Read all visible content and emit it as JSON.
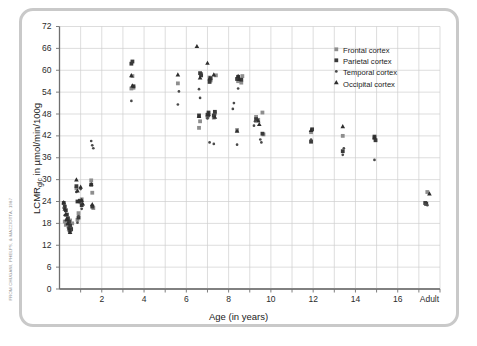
{
  "credit": "FROM CHUGANI, PHELPS, & MAZZIOTTA, 1987",
  "axes": {
    "xlabel": "Age (in years)",
    "ylabel_main": "LCMR",
    "ylabel_sub": "glc",
    "ylabel_rest": " in µmol/min/100g",
    "ylabel_full": "LCMRglc in µmol/min/100g",
    "y_ticks": [
      "0",
      "6",
      "12",
      "18",
      "24",
      "30",
      "36",
      "42",
      "48",
      "54",
      "60",
      "66",
      "72"
    ],
    "x_ticks": [
      "2",
      "4",
      "6",
      "8",
      "10",
      "12",
      "14",
      "16",
      "Adult"
    ]
  },
  "legend": {
    "items": [
      {
        "label": "Frontal cortex",
        "marker": "square",
        "color": "#8e8e8e"
      },
      {
        "label": "Parietal cortex",
        "marker": "square",
        "color": "#3a3a3a"
      },
      {
        "label": "Temporal cortex",
        "marker": "dot",
        "color": "#4a4a4a"
      },
      {
        "label": "Occipital cortex",
        "marker": "triangle",
        "color": "#2e2e2e"
      }
    ]
  },
  "colors": {
    "frontal": "#8e8e8e",
    "parietal": "#3a3a3a",
    "temporal": "#4a4a4a",
    "occipital": "#2e2e2e",
    "grid": "#cfcfcf",
    "axis": "#6f6f6f",
    "frame": "#c9c9c9"
  },
  "chart_data": {
    "type": "scatter",
    "title": "",
    "xlabel": "Age (in years)",
    "ylabel": "LCMRglc in µmol/min/100g",
    "xlim": [
      0,
      18
    ],
    "ylim": [
      0,
      72
    ],
    "ytick_step": 6,
    "xtick_step": 2,
    "x_gridline_step": 1,
    "grid": true,
    "legend_position": "top-right",
    "x_adult_value": 17.5,
    "series": [
      {
        "name": "Frontal cortex",
        "marker": "square",
        "color": "#8e8e8e",
        "points": [
          [
            0.25,
            18.5
          ],
          [
            0.3,
            17.6
          ],
          [
            0.35,
            19.0
          ],
          [
            0.4,
            18.2
          ],
          [
            0.45,
            17.2
          ],
          [
            0.5,
            18.8
          ],
          [
            0.55,
            16.6
          ],
          [
            0.6,
            18.0
          ],
          [
            0.8,
            27.6
          ],
          [
            0.85,
            19.0
          ],
          [
            0.9,
            20.8
          ],
          [
            1.0,
            23.8
          ],
          [
            1.05,
            24.6
          ],
          [
            1.5,
            29.8
          ],
          [
            1.55,
            26.4
          ],
          [
            1.6,
            22.2
          ],
          [
            3.4,
            55.0
          ],
          [
            3.45,
            58.4
          ],
          [
            3.5,
            55.2
          ],
          [
            5.6,
            56.4
          ],
          [
            6.6,
            44.2
          ],
          [
            6.65,
            46.0
          ],
          [
            6.7,
            59.0
          ],
          [
            7.0,
            47.2
          ],
          [
            7.05,
            47.8
          ],
          [
            7.1,
            58.0
          ],
          [
            7.15,
            57.2
          ],
          [
            7.3,
            47.0
          ],
          [
            7.35,
            48.2
          ],
          [
            7.4,
            58.6
          ],
          [
            8.4,
            43.6
          ],
          [
            8.45,
            57.0
          ],
          [
            8.6,
            56.6
          ],
          [
            8.65,
            58.4
          ],
          [
            9.3,
            47.2
          ],
          [
            9.4,
            46.4
          ],
          [
            9.6,
            48.4
          ],
          [
            9.65,
            42.4
          ],
          [
            11.9,
            43.0
          ],
          [
            13.4,
            42.0
          ],
          [
            14.9,
            41.4
          ],
          [
            17.4,
            26.6
          ]
        ]
      },
      {
        "name": "Parietal cortex",
        "marker": "square",
        "color": "#3a3a3a",
        "points": [
          [
            0.2,
            23.6
          ],
          [
            0.25,
            22.6
          ],
          [
            0.3,
            21.6
          ],
          [
            0.35,
            20.4
          ],
          [
            0.4,
            19.4
          ],
          [
            0.45,
            18.4
          ],
          [
            0.5,
            17.4
          ],
          [
            0.55,
            16.4
          ],
          [
            0.8,
            28.2
          ],
          [
            0.85,
            24.0
          ],
          [
            0.9,
            19.6
          ],
          [
            1.0,
            24.2
          ],
          [
            1.05,
            23.0
          ],
          [
            1.5,
            28.6
          ],
          [
            1.55,
            22.6
          ],
          [
            3.4,
            61.8
          ],
          [
            3.45,
            62.4
          ],
          [
            3.5,
            55.6
          ],
          [
            6.6,
            47.6
          ],
          [
            6.65,
            59.2
          ],
          [
            6.7,
            58.6
          ],
          [
            7.0,
            47.8
          ],
          [
            7.05,
            48.4
          ],
          [
            7.1,
            56.8
          ],
          [
            7.15,
            57.8
          ],
          [
            7.3,
            47.6
          ],
          [
            7.35,
            48.6
          ],
          [
            8.4,
            57.6
          ],
          [
            8.45,
            58.2
          ],
          [
            8.6,
            57.4
          ],
          [
            9.3,
            46.6
          ],
          [
            9.6,
            42.6
          ],
          [
            11.9,
            40.4
          ],
          [
            11.95,
            43.8
          ],
          [
            13.4,
            37.8
          ],
          [
            14.9,
            41.8
          ],
          [
            14.95,
            40.8
          ],
          [
            17.3,
            23.6
          ],
          [
            17.35,
            23.4
          ]
        ]
      },
      {
        "name": "Temporal cortex",
        "marker": "dot",
        "color": "#4a4a4a",
        "points": [
          [
            0.2,
            22.2
          ],
          [
            0.25,
            20.2
          ],
          [
            0.3,
            18.8
          ],
          [
            0.35,
            17.8
          ],
          [
            0.4,
            16.8
          ],
          [
            0.45,
            15.8
          ],
          [
            0.5,
            15.4
          ],
          [
            0.55,
            16.0
          ],
          [
            0.8,
            26.6
          ],
          [
            0.85,
            18.2
          ],
          [
            0.9,
            20.0
          ],
          [
            1.0,
            27.4
          ],
          [
            1.05,
            22.0
          ],
          [
            1.5,
            40.6
          ],
          [
            1.55,
            39.4
          ],
          [
            1.6,
            38.6
          ],
          [
            3.4,
            51.6
          ],
          [
            5.6,
            50.6
          ],
          [
            5.65,
            54.2
          ],
          [
            6.6,
            54.8
          ],
          [
            6.65,
            52.4
          ],
          [
            7.0,
            46.8
          ],
          [
            7.05,
            47.4
          ],
          [
            7.1,
            40.2
          ],
          [
            7.3,
            39.8
          ],
          [
            7.35,
            47.6
          ],
          [
            8.2,
            49.4
          ],
          [
            8.25,
            51.0
          ],
          [
            8.4,
            39.6
          ],
          [
            8.45,
            55.0
          ],
          [
            9.2,
            44.8
          ],
          [
            9.25,
            46.0
          ],
          [
            9.5,
            41.0
          ],
          [
            9.55,
            40.2
          ],
          [
            11.9,
            41.0
          ],
          [
            13.4,
            36.8
          ],
          [
            13.45,
            38.6
          ],
          [
            14.9,
            35.4
          ],
          [
            17.3,
            23.2
          ],
          [
            17.4,
            23.0
          ]
        ]
      },
      {
        "name": "Occipital cortex",
        "marker": "triangle",
        "color": "#2e2e2e",
        "points": [
          [
            0.2,
            23.8
          ],
          [
            0.25,
            22.0
          ],
          [
            0.3,
            20.6
          ],
          [
            0.35,
            19.2
          ],
          [
            0.4,
            18.0
          ],
          [
            0.45,
            16.6
          ],
          [
            0.5,
            15.6
          ],
          [
            0.8,
            30.0
          ],
          [
            0.85,
            27.0
          ],
          [
            0.9,
            24.2
          ],
          [
            1.0,
            28.0
          ],
          [
            1.05,
            24.4
          ],
          [
            1.1,
            23.4
          ],
          [
            1.5,
            28.8
          ],
          [
            1.55,
            23.2
          ],
          [
            3.4,
            58.6
          ],
          [
            3.45,
            55.8
          ],
          [
            5.6,
            58.8
          ],
          [
            6.5,
            66.6
          ],
          [
            6.6,
            47.4
          ],
          [
            6.65,
            58.0
          ],
          [
            7.0,
            62.0
          ],
          [
            7.05,
            48.0
          ],
          [
            7.1,
            57.8
          ],
          [
            7.3,
            58.8
          ],
          [
            7.35,
            47.2
          ],
          [
            8.4,
            43.4
          ],
          [
            8.45,
            58.4
          ],
          [
            8.5,
            57.6
          ],
          [
            9.4,
            46.2
          ],
          [
            9.45,
            45.2
          ],
          [
            11.9,
            43.6
          ],
          [
            13.4,
            44.6
          ],
          [
            14.9,
            41.6
          ],
          [
            17.5,
            26.2
          ]
        ]
      }
    ]
  }
}
